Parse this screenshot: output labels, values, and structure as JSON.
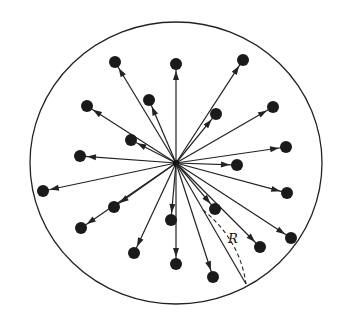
{
  "diagram": {
    "center": [
      176,
      163
    ],
    "boundary": {
      "cx": 176,
      "cy": 163,
      "rx": 146,
      "ry": 141
    },
    "radius_label": "R",
    "radius_end": [
      246,
      284
    ],
    "particles": [
      [
        115,
        62
      ],
      [
        176,
        64
      ],
      [
        243,
        60
      ],
      [
        87,
        106
      ],
      [
        149,
        100
      ],
      [
        216,
        114
      ],
      [
        273,
        107
      ],
      [
        131,
        140
      ],
      [
        80,
        156
      ],
      [
        286,
        147
      ],
      [
        237,
        165
      ],
      [
        43,
        191
      ],
      [
        287,
        193
      ],
      [
        114,
        207
      ],
      [
        215,
        209
      ],
      [
        81,
        228
      ],
      [
        171,
        220
      ],
      [
        291,
        238
      ],
      [
        134,
        253
      ],
      [
        176,
        264
      ],
      [
        260,
        247
      ],
      [
        213,
        277
      ]
    ]
  }
}
